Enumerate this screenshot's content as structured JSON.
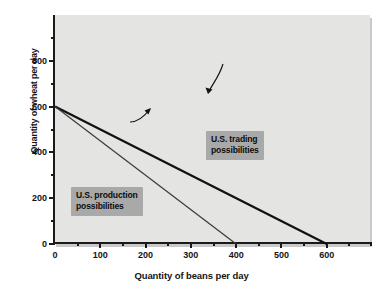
{
  "chart_data": {
    "type": "line",
    "title": "",
    "xlabel": "Quantity of beans per day",
    "ylabel": "Quantity of wheat per day",
    "xlim": [
      0,
      700
    ],
    "ylim": [
      0,
      1000
    ],
    "grid": false,
    "legend_position": "inline-annotations",
    "x_ticks_major": [
      0,
      100,
      200,
      300,
      400,
      500,
      600
    ],
    "x_ticks_major_labels": [
      "0",
      "100",
      "200",
      "300",
      "400",
      "500",
      "600"
    ],
    "x_ticks_minor": [
      50,
      150,
      250,
      350,
      450,
      550,
      650
    ],
    "y_ticks_major": [
      0,
      200,
      400,
      600,
      800
    ],
    "y_ticks_major_labels": [
      "0",
      "200",
      "400",
      "600",
      "800"
    ],
    "y_ticks_minor": [
      100,
      300,
      500,
      700,
      900
    ],
    "series": [
      {
        "name": "U.S. trading possibilities",
        "points": [
          [
            0,
            600
          ],
          [
            600,
            0
          ]
        ],
        "color": "#111111",
        "width": 2.2
      },
      {
        "name": "U.S. production possibilities",
        "points": [
          [
            0,
            600
          ],
          [
            400,
            0
          ]
        ],
        "color": "#3a3a3a",
        "width": 1.2
      }
    ],
    "annotations": [
      {
        "name": "trading-possibilities-label",
        "text": "U.S. trading\npossibilities",
        "points_to": [
          400,
          210
        ]
      },
      {
        "name": "production-possibilities-label",
        "text": "U.S. production\npossibilities",
        "points_to": [
          248,
          228
        ]
      }
    ]
  },
  "colors": {
    "plot_background": "#e4e4e2",
    "page_background": "#ffffff",
    "axis": "#1a1a1a",
    "callout_background": "#a9a9a9",
    "text": "#141414"
  }
}
